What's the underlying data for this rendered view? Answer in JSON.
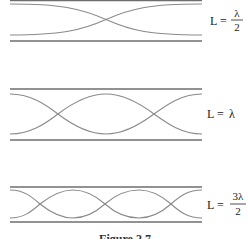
{
  "figure": {
    "panels": [
      {
        "id": "half",
        "label_lhs": "L =",
        "label_num": "λ",
        "label_den": "2",
        "label_plain": "",
        "half_wavelengths": 1
      },
      {
        "id": "full",
        "label_lhs": "L =",
        "label_num": "",
        "label_den": "",
        "label_plain": "λ",
        "half_wavelengths": 2
      },
      {
        "id": "three-half",
        "label_lhs": "L =",
        "label_num": "3λ",
        "label_den": "2",
        "label_plain": "",
        "half_wavelengths": 3
      }
    ],
    "caption": "Figure 2.7"
  }
}
